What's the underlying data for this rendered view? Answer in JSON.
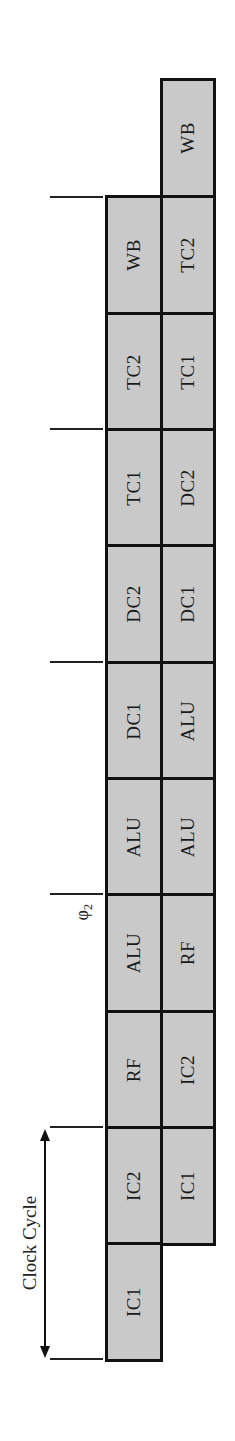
{
  "diagram": {
    "type": "pipeline-timing-diagram",
    "orientation": "rotated-90-ccw",
    "clock_cycle_label": "Clock Cycle",
    "phase_label": "φ",
    "phase_subscript": "2",
    "colors": {
      "cell_fill": "#c9c9c9",
      "cell_border": "#111111",
      "background": "#ffffff"
    },
    "rows": [
      {
        "name": "instruction-1",
        "stages": [
          "IC1",
          "IC2",
          "RF",
          "ALU",
          "ALU",
          "DC1",
          "DC2",
          "TC1",
          "TC2",
          "WB"
        ]
      },
      {
        "name": "instruction-2",
        "stages": [
          "IC1",
          "IC2",
          "RF",
          "ALU",
          "ALU",
          "DC1",
          "DC2",
          "TC1",
          "TC2",
          "WB"
        ]
      }
    ],
    "ticks": 6
  }
}
